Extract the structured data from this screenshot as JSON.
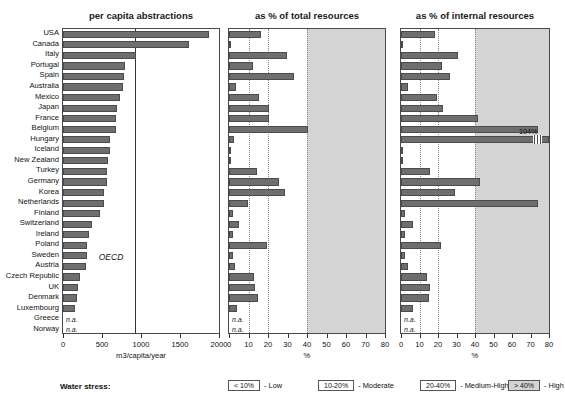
{
  "panels": [
    {
      "key": "abstractions",
      "title": "per capita abstractions",
      "axis_label": "m3/capita/year",
      "ticks": [
        0,
        500,
        1000,
        1500,
        2000
      ],
      "xmin": 0,
      "xmax": 2000,
      "marker": {
        "label": "OECD",
        "value": 920
      }
    },
    {
      "key": "total",
      "title": "as % of total resources",
      "axis_label": "%",
      "ticks": [
        0,
        10,
        20,
        30,
        40,
        50,
        60,
        70,
        80
      ],
      "xmin": 0,
      "xmax": 80,
      "grid": [
        10,
        20
      ],
      "stress_from": 40
    },
    {
      "key": "internal",
      "title": "as % of internal resources",
      "axis_label": "%",
      "ticks": [
        0,
        10,
        20,
        30,
        40,
        50,
        60,
        70,
        80
      ],
      "xmin": 0,
      "xmax": 80,
      "grid": [
        10,
        20
      ],
      "stress_from": 40
    }
  ],
  "legend": {
    "title": "Water stress:",
    "items": [
      {
        "swatch": "< 10%",
        "text": "- Low",
        "shaded": false
      },
      {
        "swatch": "10-20%",
        "text": "- Moderate",
        "shaded": false
      },
      {
        "swatch": "20-40%",
        "text": "- Medium-High",
        "shaded": false
      },
      {
        "swatch": "> 40%",
        "text": "- High",
        "shaded": true
      }
    ]
  },
  "na_text": "n.a.",
  "colors": {
    "bar": "#6e6e6e",
    "bar_edge": "#4b4b4b",
    "stress_band": "#d4d4d4",
    "grid": "#8a8a8a",
    "axis": "#333333"
  },
  "chart_data": {
    "type": "bar",
    "orientation": "horizontal",
    "categories": [
      "USA",
      "Canada",
      "Italy",
      "Portugal",
      "Spain",
      "Australia",
      "Mexico",
      "Japan",
      "France",
      "Belgium",
      "Hungary",
      "Iceland",
      "New Zealand",
      "Turkey",
      "Germany",
      "Korea",
      "Netherlands",
      "Finland",
      "Switzerland",
      "Ireland",
      "Poland",
      "Sweden",
      "Austria",
      "Czech Republic",
      "UK",
      "Denmark",
      "Luxembourg",
      "Greece",
      "Norway"
    ],
    "series": [
      {
        "name": "per capita abstractions",
        "units": "m3/capita/year",
        "xlabel": "m3/capita/year",
        "xlim": [
          0,
          2000
        ],
        "values": [
          1870,
          1610,
          940,
          790,
          780,
          770,
          730,
          690,
          680,
          680,
          600,
          600,
          580,
          560,
          560,
          530,
          520,
          480,
          370,
          330,
          310,
          305,
          290,
          220,
          195,
          180,
          150,
          null,
          null
        ]
      },
      {
        "name": "as % of total resources",
        "units": "%",
        "xlabel": "%",
        "xlim": [
          0,
          80
        ],
        "values": [
          16.5,
          1.2,
          29.5,
          12.5,
          33.5,
          3.5,
          15.5,
          20.5,
          20.5,
          40.5,
          2.5,
          0.3,
          0.6,
          14.5,
          25.5,
          28.5,
          9.5,
          2.2,
          5.0,
          2.0,
          19.5,
          1.8,
          3.0,
          13.0,
          13.5,
          15.0,
          4.0,
          null,
          null
        ]
      },
      {
        "name": "as % of internal resources",
        "units": "%",
        "xlabel": "%",
        "xlim": [
          0,
          80
        ],
        "values": [
          18.5,
          1.3,
          31.0,
          22.0,
          26.5,
          4.0,
          19.5,
          22.5,
          41.5,
          74.0,
          104.0,
          0.4,
          0.6,
          15.5,
          42.5,
          29.0,
          74.0,
          2.2,
          6.5,
          2.0,
          21.5,
          2.2,
          4.0,
          14.0,
          15.5,
          15.0,
          6.5,
          null,
          null
        ]
      }
    ],
    "annotations": [
      {
        "panel": "internal",
        "category": "Hungary",
        "label": "104%",
        "note": "bar extends beyond axis, shown with axis break"
      }
    ],
    "stress_thresholds": {
      "low": "< 10%",
      "moderate": "10-20%",
      "medium_high": "20-40%",
      "high": "> 40%"
    },
    "grid": "dotted vertical at 10 and 20; shaded band from 40 to 80",
    "legend_position": "bottom"
  }
}
